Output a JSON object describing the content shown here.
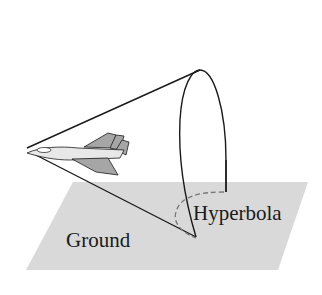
{
  "diagram": {
    "labels": {
      "ground": "Ground",
      "hyperbola": "Hyperbola"
    },
    "colors": {
      "ground_fill": "#d9d9d9",
      "line": "#1a1a1a",
      "jet_light": "#e8e8e8",
      "jet_dark": "#a6a6a6",
      "dashed": "#777777"
    }
  }
}
